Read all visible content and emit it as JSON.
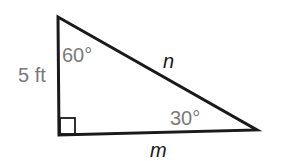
{
  "diagram": {
    "type": "right-triangle",
    "vertical_leg_label": "5 ft",
    "top_angle_label": "60°",
    "right_angle_label": "30°",
    "hypotenuse_label": "n",
    "bottom_leg_label": "m",
    "line_color": "#1a1a1a",
    "label_color": "#7a7a7a"
  }
}
